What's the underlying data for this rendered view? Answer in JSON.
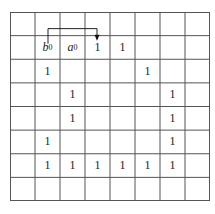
{
  "grid": {
    "rows": 8,
    "cols": 8,
    "line_color": "#555555",
    "cells": [
      {
        "row": 1,
        "col": 1,
        "text": "b",
        "sub": "0",
        "italic": true
      },
      {
        "row": 1,
        "col": 2,
        "text": "a",
        "sub": "0",
        "italic": true
      },
      {
        "row": 1,
        "col": 3,
        "text": "1"
      },
      {
        "row": 1,
        "col": 4,
        "text": "1"
      },
      {
        "row": 2,
        "col": 1,
        "text": "1"
      },
      {
        "row": 2,
        "col": 5,
        "text": "1"
      },
      {
        "row": 3,
        "col": 2,
        "text": "1"
      },
      {
        "row": 3,
        "col": 6,
        "text": "1"
      },
      {
        "row": 4,
        "col": 2,
        "text": "1"
      },
      {
        "row": 4,
        "col": 6,
        "text": "1"
      },
      {
        "row": 5,
        "col": 1,
        "text": "1"
      },
      {
        "row": 5,
        "col": 6,
        "text": "1"
      },
      {
        "row": 6,
        "col": 1,
        "text": "1"
      },
      {
        "row": 6,
        "col": 2,
        "text": "1"
      },
      {
        "row": 6,
        "col": 3,
        "text": "1"
      },
      {
        "row": 6,
        "col": 4,
        "text": "1"
      },
      {
        "row": 6,
        "col": 5,
        "text": "1"
      },
      {
        "row": 6,
        "col": 6,
        "text": "1"
      }
    ],
    "arrow": {
      "from_cell": [
        1,
        1
      ],
      "to_cell": [
        1,
        3
      ],
      "description": "arrow from b0 cell to the 1 in column 3"
    }
  }
}
